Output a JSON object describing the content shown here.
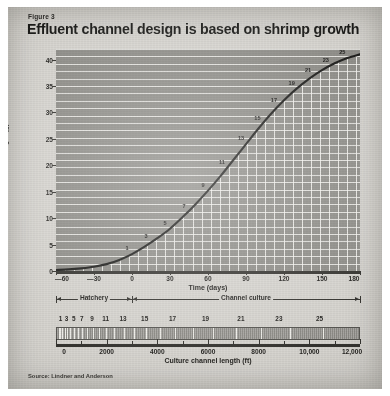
{
  "figure": {
    "label": "Figure 3",
    "title": "Effluent channel design is based on shrimp growth",
    "source": "Source: Lindner and Anderson"
  },
  "chart_data": {
    "type": "line",
    "title": "Effluent channel design is based on shrimp growth",
    "xlabel": "Time (days)",
    "ylabel": "Weight (g)",
    "xlim": [
      -60,
      180
    ],
    "ylim": [
      0,
      42
    ],
    "grid": true,
    "legend": "none",
    "x_ticks": [
      -60,
      -30,
      0,
      30,
      60,
      90,
      120,
      150,
      180
    ],
    "x_tick_labels": [
      "—60",
      "—30",
      "0",
      "30",
      "60",
      "90",
      "120",
      "150",
      "180"
    ],
    "y_ticks": [
      0,
      5,
      10,
      15,
      20,
      25,
      30,
      35,
      40
    ],
    "y_tick_labels": [
      "0",
      "5",
      "10",
      "15",
      "20",
      "25",
      "30",
      "35",
      "40"
    ],
    "series": [
      {
        "name": "Shrimp weight",
        "x": [
          -60,
          -50,
          -40,
          -30,
          -20,
          -10,
          0,
          10,
          20,
          30,
          40,
          50,
          60,
          70,
          80,
          90,
          100,
          110,
          120,
          130,
          140,
          150,
          160,
          170,
          180
        ],
        "values": [
          0.2,
          0.3,
          0.5,
          0.8,
          1.3,
          2.1,
          3.2,
          4.6,
          6.2,
          8.0,
          10.2,
          12.6,
          15.2,
          18.0,
          21.0,
          24.0,
          27.0,
          29.8,
          32.3,
          34.5,
          36.4,
          38.0,
          39.3,
          40.3,
          41.0
        ]
      }
    ],
    "point_annotations": [
      {
        "label": "1",
        "x": 0,
        "y": 3.2
      },
      {
        "label": "3",
        "x": 15,
        "y": 5.4
      },
      {
        "label": "5",
        "x": 30,
        "y": 8.0
      },
      {
        "label": "7",
        "x": 45,
        "y": 11.2
      },
      {
        "label": "9",
        "x": 60,
        "y": 15.2
      },
      {
        "label": "11",
        "x": 75,
        "y": 19.5
      },
      {
        "label": "13",
        "x": 90,
        "y": 24.0
      },
      {
        "label": "15",
        "x": 103,
        "y": 27.8
      },
      {
        "label": "17",
        "x": 116,
        "y": 31.3
      },
      {
        "label": "19",
        "x": 130,
        "y": 34.5
      },
      {
        "label": "21",
        "x": 143,
        "y": 36.8
      },
      {
        "label": "23",
        "x": 157,
        "y": 38.7
      },
      {
        "label": "25",
        "x": 170,
        "y": 40.3
      }
    ],
    "phases": [
      {
        "name": "Hatchery",
        "from": -60,
        "to": 0
      },
      {
        "name": "Channel culture",
        "from": 0,
        "to": 180
      }
    ],
    "secondary_axis": {
      "label": "Culture channel length (ft)",
      "ticks": [
        0,
        2000,
        4000,
        6000,
        8000,
        10000,
        12000
      ],
      "tick_labels": [
        "0",
        "2000",
        "4000",
        "6000",
        "8000",
        "10,000",
        "12,000"
      ],
      "minor_ticks": [
        1000,
        3000,
        5000,
        7000,
        9000,
        11000
      ],
      "lim": [
        0,
        12000
      ],
      "segment_labels": [
        "1",
        "3",
        "5",
        "7",
        "9",
        "11",
        "13",
        "15",
        "17",
        "19",
        "21",
        "23",
        "25"
      ],
      "segment_positions_ft": [
        180,
        420,
        700,
        1020,
        1420,
        1960,
        2650,
        3500,
        4600,
        5900,
        7300,
        8800,
        10400
      ],
      "segment_count": 26
    }
  },
  "colors": {
    "paper": "#d6d4cf",
    "plot_fill": "#8e8d88",
    "grid": "#f5f4f0",
    "ink": "#1a1a18",
    "curve": "#1a1a18"
  }
}
